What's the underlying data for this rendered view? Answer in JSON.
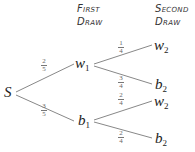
{
  "headers": {
    "first": [
      "First",
      "Draw"
    ],
    "second": [
      "Second",
      "Draw"
    ]
  },
  "nodes": {
    "root": {
      "label": "S"
    },
    "w1": {
      "base": "w",
      "sub": "1"
    },
    "b1": {
      "base": "b",
      "sub": "1"
    },
    "w2_top": {
      "base": "w",
      "sub": "2"
    },
    "b2_top": {
      "base": "b",
      "sub": "2"
    },
    "w2_bottom": {
      "base": "w",
      "sub": "2"
    },
    "b2_bottom": {
      "base": "b",
      "sub": "2"
    }
  },
  "edges": {
    "s_w1": {
      "num": "2",
      "den": "5"
    },
    "s_b1": {
      "num": "3",
      "den": "5"
    },
    "w1_w2": {
      "num": "1",
      "den": "4"
    },
    "w1_b2": {
      "num": "3",
      "den": "4"
    },
    "b1_w2": {
      "num": "2",
      "den": "4"
    },
    "b1_b2": {
      "num": "2",
      "den": "4"
    }
  },
  "colors": {
    "line": "#888888",
    "text": "#222222"
  }
}
